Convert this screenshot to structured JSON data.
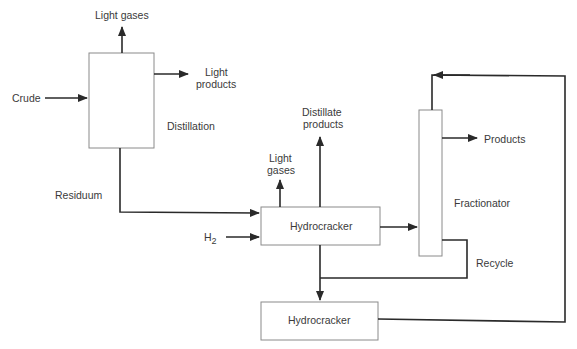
{
  "diagram": {
    "type": "process-flow",
    "units": {
      "distillation": "Distillation",
      "hydrocracker_1": "Hydrocracker",
      "hydrocracker_2": "Hydrocracker",
      "fractionator": "Fractionator"
    },
    "streams": {
      "crude": "Crude",
      "light_gases_top": "Light gases",
      "light_products_line1": "Light",
      "light_products_line2": "products",
      "residuum": "Residuum",
      "h2_main": "H",
      "h2_sub": "2",
      "light_gases_hc_line1": "Light",
      "light_gases_hc_line2": "gases",
      "distillate_line1": "Distillate",
      "distillate_line2": "products",
      "products": "Products",
      "recycle": "Recycle"
    },
    "connections": [
      {
        "from": "Crude",
        "to": "Distillation"
      },
      {
        "from": "Distillation",
        "to": "Light gases"
      },
      {
        "from": "Distillation",
        "to": "Light products"
      },
      {
        "from": "Distillation",
        "to": "Hydrocracker",
        "label": "Residuum"
      },
      {
        "from": "H2",
        "to": "Hydrocracker"
      },
      {
        "from": "Hydrocracker",
        "to": "Light gases"
      },
      {
        "from": "Hydrocracker",
        "to": "Distillate products"
      },
      {
        "from": "Hydrocracker",
        "to": "Fractionator"
      },
      {
        "from": "Fractionator",
        "to": "Products"
      },
      {
        "from": "Fractionator",
        "to": "Hydrocracker (2)",
        "label": "Recycle"
      },
      {
        "from": "Hydrocracker",
        "to": "Hydrocracker (2)"
      },
      {
        "from": "Hydrocracker (2)",
        "to": "Fractionator"
      }
    ]
  }
}
